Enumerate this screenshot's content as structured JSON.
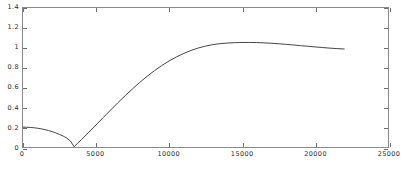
{
  "chart_data": {
    "type": "line",
    "title": "",
    "subtitle": "",
    "xlabel": "",
    "ylabel": "",
    "xlim": [
      0,
      25000
    ],
    "ylim": [
      0,
      1.4
    ],
    "grid": false,
    "legend": null,
    "legend_position": "none",
    "xticks": [
      0,
      5000,
      10000,
      15000,
      20000,
      25000
    ],
    "xticklabels": [
      "0",
      "5000",
      "10000",
      "15000",
      "20000",
      "25000"
    ],
    "yticks": [
      0,
      0.2,
      0.4,
      0.6,
      0.8,
      1.0,
      1.2,
      1.4
    ],
    "yticklabels": [
      "0",
      "0.2",
      "0.4",
      "0.6",
      "0.8",
      "1",
      "1.2",
      "1.4"
    ],
    "line_color": "#303030",
    "line_width": 0.9,
    "series": [
      {
        "name": "curve",
        "x": [
          0,
          250,
          500,
          750,
          1000,
          1250,
          1500,
          1750,
          2000,
          2250,
          2500,
          2750,
          3000,
          3250,
          3500,
          3750,
          4000,
          4500,
          5000,
          5500,
          6000,
          6500,
          7000,
          7500,
          8000,
          8500,
          9000,
          9500,
          10000,
          10500,
          11000,
          11500,
          12000,
          12500,
          13000,
          13500,
          14000,
          14500,
          15000,
          15500,
          16000,
          16500,
          17000,
          17500,
          18000,
          18500,
          19000,
          19500,
          20000,
          20500,
          21000,
          21500,
          22000
        ],
        "y": [
          0.2,
          0.199,
          0.197,
          0.194,
          0.189,
          0.183,
          0.175,
          0.166,
          0.155,
          0.142,
          0.127,
          0.11,
          0.09,
          0.06,
          0.003,
          0.038,
          0.074,
          0.147,
          0.222,
          0.297,
          0.372,
          0.446,
          0.517,
          0.586,
          0.651,
          0.712,
          0.768,
          0.82,
          0.866,
          0.907,
          0.942,
          0.972,
          0.997,
          1.016,
          1.031,
          1.041,
          1.047,
          1.051,
          1.053,
          1.053,
          1.052,
          1.049,
          1.045,
          1.04,
          1.034,
          1.028,
          1.021,
          1.015,
          1.008,
          1.002,
          0.996,
          0.991,
          0.987
        ]
      }
    ],
    "annotations": [
      {
        "label": "start-value",
        "x": 0,
        "y": 0.2
      },
      {
        "label": "minimum",
        "x": 3500,
        "y": 0.0
      },
      {
        "label": "peak",
        "x": 15600,
        "y": 1.05
      },
      {
        "label": "end-value",
        "x": 22000,
        "y": 0.99
      }
    ]
  },
  "axes": {
    "y_tick_labels": [
      "1.4",
      "1.2",
      "1",
      "0.8",
      "0.6",
      "0.4",
      "0.2",
      "0"
    ],
    "x_tick_labels": [
      "0",
      "5000",
      "10000",
      "15000",
      "20000",
      "25000"
    ]
  }
}
